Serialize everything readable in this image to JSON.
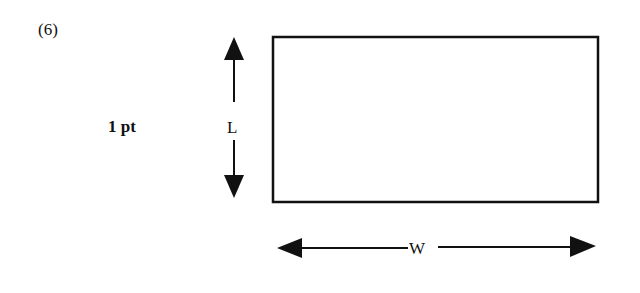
{
  "problem": {
    "number_label": "(6)",
    "points_label": "1 pt"
  },
  "diagram": {
    "shape": "rectangle",
    "length_label": "L",
    "width_label": "W",
    "stroke_color": "#111111",
    "rectangle": {
      "x": 272,
      "y": 37,
      "width": 326,
      "height": 165
    }
  }
}
